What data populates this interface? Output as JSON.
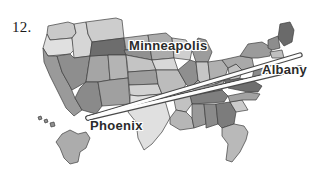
{
  "figure": {
    "number_label": "12.",
    "background_color": "#ffffff"
  },
  "map": {
    "region": "United States",
    "outline_color": "#3d3d3d",
    "includes_alaska": true,
    "includes_hawaii": true,
    "shades": {
      "lightest": "#e2e2e2",
      "light": "#cfcfcf",
      "medium_light": "#bdbdbd",
      "medium": "#a8a8a8",
      "medium_dark": "#949494",
      "dark": "#7d7d7d",
      "darkest": "#5e5e5e"
    }
  },
  "routes": {
    "line_fill_color": "#fcfcfc",
    "line_edge_color": "#4a4a4a",
    "origin": "Phoenix",
    "paths": [
      {
        "name": "phoenix-to-minneapolis-northeast",
        "from": "Phoenix",
        "to": "Albany"
      },
      {
        "name": "phoenix-to-albany",
        "from": "Phoenix",
        "to": "Albany"
      }
    ]
  },
  "labels": [
    {
      "name": "minneapolis",
      "text": "Minneapolis"
    },
    {
      "name": "albany",
      "text": "Albany"
    },
    {
      "name": "phoenix",
      "text": "Phoenix"
    }
  ]
}
